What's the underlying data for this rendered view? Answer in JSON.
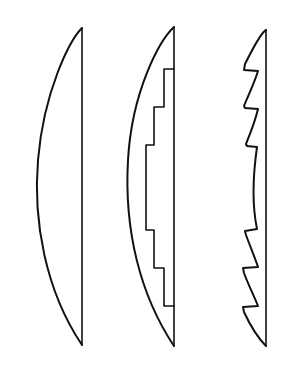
{
  "diagram": {
    "title": "",
    "colors": {
      "line": "#111111",
      "background": "#ffffff"
    },
    "figures": [
      {
        "id": "plano-convex-lens",
        "label": ""
      },
      {
        "id": "stepped-lens",
        "label": ""
      },
      {
        "id": "fresnel-lens",
        "label": ""
      }
    ]
  }
}
